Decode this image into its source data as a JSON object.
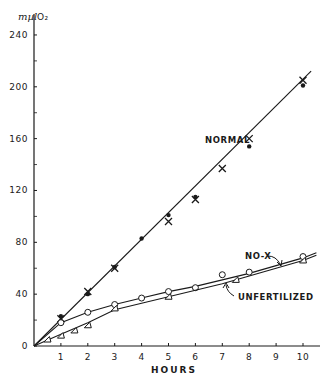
{
  "chart_data": {
    "type": "line",
    "title": "",
    "xlabel": "HOURS",
    "ylabel": "mµl O2",
    "ylabel_unit": "mµl",
    "ylabel_gas": "O₂",
    "xlim": [
      0,
      10.5
    ],
    "ylim": [
      0,
      250
    ],
    "x_ticks": [
      1,
      2,
      3,
      4,
      5,
      6,
      7,
      8,
      9,
      10
    ],
    "y_ticks": [
      0,
      40,
      80,
      120,
      160,
      200,
      240
    ],
    "y_minor_ticks": [
      20,
      60,
      100,
      140,
      180,
      220
    ],
    "grid": false,
    "legend": "inline labels",
    "series": [
      {
        "name": "NORMAL",
        "marker": "x",
        "points": [
          [
            1,
            21
          ],
          [
            2,
            42
          ],
          [
            3,
            60
          ],
          [
            5,
            96
          ],
          [
            6,
            113
          ],
          [
            7,
            137
          ],
          [
            8,
            160
          ],
          [
            10,
            205
          ]
        ],
        "fit_line": [
          [
            0,
            0
          ],
          [
            10.3,
            212
          ]
        ]
      },
      {
        "name": "NORMAL (dots)",
        "marker": "dot",
        "points": [
          [
            1,
            23
          ],
          [
            2,
            40
          ],
          [
            3,
            61
          ],
          [
            4,
            83
          ],
          [
            5,
            101
          ],
          [
            6,
            115
          ],
          [
            8,
            154
          ],
          [
            10,
            201
          ]
        ]
      },
      {
        "name": "NO-X",
        "marker": "circle",
        "points": [
          [
            1,
            18
          ],
          [
            2,
            26
          ],
          [
            3,
            32
          ],
          [
            4,
            37
          ],
          [
            5,
            42
          ],
          [
            6,
            45
          ],
          [
            7,
            55
          ],
          [
            8,
            57
          ],
          [
            10,
            69
          ]
        ],
        "curve": [
          [
            0,
            0
          ],
          [
            1,
            18
          ],
          [
            2,
            26
          ],
          [
            3,
            32
          ],
          [
            4,
            37
          ],
          [
            5,
            42
          ],
          [
            6,
            46
          ],
          [
            7,
            51
          ],
          [
            8,
            56
          ],
          [
            9,
            62
          ],
          [
            10,
            68
          ],
          [
            10.5,
            72
          ]
        ]
      },
      {
        "name": "UNFERTILIZED",
        "marker": "triangle",
        "points": [
          [
            0.5,
            5
          ],
          [
            1,
            8
          ],
          [
            1.5,
            12
          ],
          [
            2,
            16
          ],
          [
            3,
            29
          ],
          [
            5,
            38
          ],
          [
            7.5,
            51
          ],
          [
            10,
            66
          ]
        ],
        "curve": [
          [
            0,
            0
          ],
          [
            1,
            9
          ],
          [
            2,
            18
          ],
          [
            3,
            28
          ],
          [
            4,
            33
          ],
          [
            5,
            38
          ],
          [
            6,
            43
          ],
          [
            7,
            48
          ],
          [
            8,
            54
          ],
          [
            9,
            60
          ],
          [
            10,
            66
          ],
          [
            10.5,
            70
          ]
        ]
      }
    ],
    "annotations": [
      {
        "text": "NORMAL",
        "near": [
          8,
          160
        ]
      },
      {
        "text": "NO-X",
        "arrow_to": [
          8.2,
          58
        ]
      },
      {
        "text": "UNFERTILIZED",
        "arrow_to": [
          7.8,
          52
        ]
      }
    ]
  },
  "labels": {
    "unit": "mµl",
    "gas": "O₂",
    "xlabel": "HOURS",
    "normal": "NORMAL",
    "nox": "NO-X",
    "unfertilized": "UNFERTILIZED"
  }
}
